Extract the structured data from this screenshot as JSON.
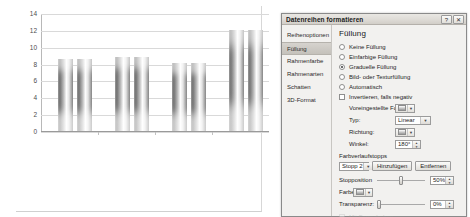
{
  "chart_data": {
    "type": "bar",
    "title": "",
    "xlabel": "",
    "ylabel": "",
    "ylim": [
      0,
      14
    ],
    "yticks": [
      0,
      2,
      4,
      6,
      8,
      10,
      12,
      14
    ],
    "grid": true,
    "legend": "none",
    "categories": [
      "1",
      "2",
      "3",
      "4"
    ],
    "series": [
      {
        "name": "Reihe 1",
        "values": [
          8.6,
          8.8,
          8.1,
          12.0
        ]
      },
      {
        "name": "Reihe 2",
        "values": [
          8.6,
          8.8,
          8.1,
          12.0
        ]
      }
    ],
    "bar_style": "gradient-cylinder"
  },
  "dialog": {
    "title": "Datenreihen formatieren",
    "help_button": "?",
    "close_button": "✕",
    "nav": {
      "items": [
        {
          "label": "Reihenoptionen",
          "active": false
        },
        {
          "label": "Füllung",
          "active": true
        },
        {
          "label": "Rahmenfarbe",
          "active": false
        },
        {
          "label": "Rahmenarten",
          "active": false
        },
        {
          "label": "Schatten",
          "active": false
        },
        {
          "label": "3D-Format",
          "active": false
        }
      ]
    },
    "fill": {
      "section_title": "Füllung",
      "options": [
        {
          "label": "Keine Füllung",
          "selected": false
        },
        {
          "label": "Einfarbige Füllung",
          "selected": false
        },
        {
          "label": "Graduelle Füllung",
          "selected": true
        },
        {
          "label": "Bild- oder Texturfüllung",
          "selected": false
        },
        {
          "label": "Automatisch",
          "selected": false
        }
      ],
      "invert_checkbox": {
        "label": "Invertieren, falls negativ",
        "checked": false
      },
      "preset_colors": {
        "label": "Voreingestellte Farben:",
        "value": ""
      },
      "type": {
        "label": "Typ:",
        "value": "Linear"
      },
      "direction": {
        "label": "Richtung:",
        "value": ""
      },
      "angle": {
        "label": "Winkel:",
        "value": "180°"
      },
      "gradient_stops": {
        "label": "Farbverlaufstopps",
        "current_stop": "Stopp 2",
        "add_button": "Hinzufügen",
        "remove_button": "Entfernen",
        "stop_position": {
          "label": "Stopposition",
          "value": "50%"
        },
        "color": {
          "label": "Farbe:",
          "value": ""
        },
        "transparency": {
          "label": "Transparenz:",
          "value": "0%"
        }
      },
      "rotate_with_shape": {
        "label": "Mit Form drehen",
        "checked": false,
        "disabled": true
      }
    }
  }
}
